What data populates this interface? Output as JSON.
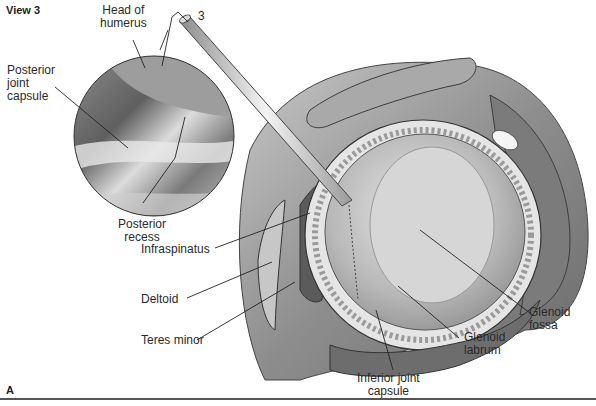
{
  "figure": {
    "view_label": "View 3",
    "panel_label": "A",
    "instrument_number": "3",
    "colors": {
      "background": "#ffffff",
      "tissue_dark": "#6e6e6e",
      "tissue_mid": "#9a9a9a",
      "tissue_light": "#d2d2d2",
      "leader_line": "#222222"
    }
  },
  "labels": {
    "head_of_humerus": [
      "Head of",
      "humerus"
    ],
    "posterior_joint_capsule": [
      "Posterior",
      "joint",
      "capsule"
    ],
    "posterior_recess": [
      "Posterior",
      "recess"
    ],
    "infraspinatus": "Infraspinatus",
    "deltoid": "Deltoid",
    "teres_minor": "Teres minor",
    "inferior_joint_capsule": [
      "Inferior joint",
      "capsule"
    ],
    "glenoid_labrum": [
      "Glenoid",
      "labrum"
    ],
    "glenoid_fossa": [
      "Glenoid",
      "fossa"
    ]
  }
}
